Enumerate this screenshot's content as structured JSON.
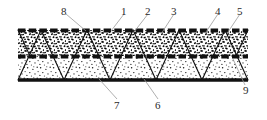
{
  "figure": {
    "colors": {
      "line": "#111111",
      "label_text": "#2a2a2a",
      "leader": "#8a8a8a",
      "speckle_dense": "#000000",
      "speckle_light": "#222222",
      "background": "#ffffff"
    },
    "layers": [
      {
        "id": "top-dashed-layer",
        "name": "top dashed face sheet",
        "style": "thick-dashed"
      },
      {
        "id": "upper-dense-fill",
        "name": "upper dense speckled layer",
        "style": "dense-stipple"
      },
      {
        "id": "middle-dashed-layer",
        "name": "middle dashed interlayer",
        "style": "thick-dashed"
      },
      {
        "id": "lower-light-fill",
        "name": "lower light speckled layer",
        "style": "light-stipple"
      },
      {
        "id": "bottom-solid-layer",
        "name": "bottom solid base plate",
        "style": "thick-solid"
      }
    ],
    "labels": [
      {
        "id": "8",
        "text": "8",
        "x": 63,
        "y": 8,
        "leader_to_x": 86,
        "leader_to_y": 30
      },
      {
        "id": "1",
        "text": "1",
        "x": 122,
        "y": 8,
        "leader_to_x": 110,
        "leader_to_y": 30
      },
      {
        "id": "2",
        "text": "2",
        "x": 146,
        "y": 8,
        "leader_to_x": 133,
        "leader_to_y": 31
      },
      {
        "id": "3",
        "text": "3",
        "x": 172,
        "y": 8,
        "leader_to_x": 160,
        "leader_to_y": 33
      },
      {
        "id": "4",
        "text": "4",
        "x": 216,
        "y": 8,
        "leader_to_x": 205,
        "leader_to_y": 31
      },
      {
        "id": "5",
        "text": "5",
        "x": 238,
        "y": 8,
        "leader_to_x": 227,
        "leader_to_y": 31
      },
      {
        "id": "9",
        "text": "9",
        "x": 246,
        "y": 88,
        "leader_to_x": 233,
        "leader_to_y": 58
      },
      {
        "id": "7",
        "text": "7",
        "x": 116,
        "y": 103,
        "leader_to_x": 98,
        "leader_to_y": 79
      },
      {
        "id": "6",
        "text": "6",
        "x": 157,
        "y": 103,
        "leader_to_x": 143,
        "leader_to_y": 79
      }
    ],
    "geometry": {
      "panel_left": 18,
      "panel_right": 248,
      "top_y": 30,
      "mid_y": 56,
      "bottom_y": 80,
      "truss_pitch": 46,
      "note": "zigzag truss diagonals span full panel height forming triangles"
    }
  }
}
